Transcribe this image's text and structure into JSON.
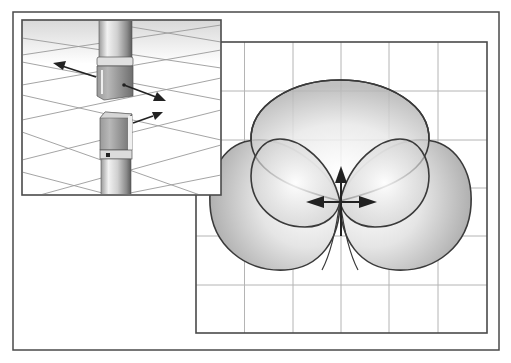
{
  "figure": {
    "colors": {
      "frame": "#4a4a4a",
      "grid": "#b0b0b0",
      "lobe_stroke": "#3a3a3a",
      "lobe_fill_dark": "#b8b8b8",
      "lobe_fill_light": "#ffffff",
      "arrow": "#222222",
      "mic_body_light": "#e6e6e6",
      "mic_body_dark": "#7a7a7a",
      "mic_head": "#8a8a8a"
    },
    "outer_frame": {
      "x": 13,
      "y": 12,
      "width": 486,
      "height": 338
    },
    "polar_plot": {
      "x": 196,
      "y": 42,
      "width": 291,
      "height": 291,
      "grid_columns": 6,
      "grid_rows": 6,
      "center": {
        "x": 340,
        "y": 201
      },
      "lobes": [
        "front-cardioid",
        "left-cardioid",
        "right-cardioid",
        "figure8-left",
        "figure8-right"
      ],
      "arrows": [
        "up",
        "left",
        "right"
      ]
    },
    "inset": {
      "x": 22,
      "y": 20,
      "width": 199,
      "height": 175,
      "content": "Perspective view of microphone with capsule separated, arrows indicating pickup directions"
    }
  }
}
